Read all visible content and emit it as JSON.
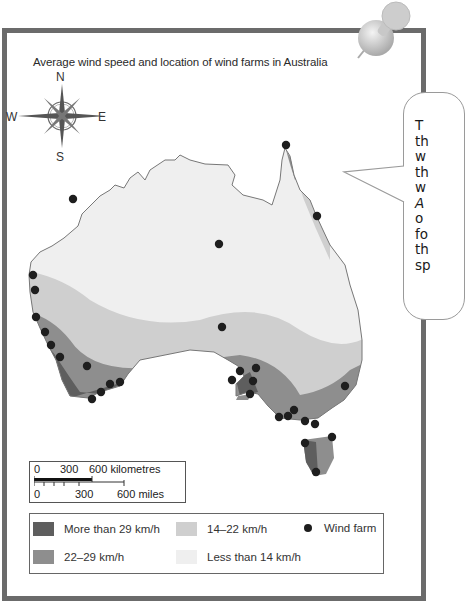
{
  "title": "Average wind speed and location of wind farms in Australia",
  "compass": {
    "north": "N",
    "south": "S",
    "east": "E",
    "west": "W"
  },
  "speech_bubble": {
    "visible_line_fragments": [
      "T",
      "th",
      "w",
      "th",
      "w",
      "A",
      "o",
      "fo",
      "th",
      "sp"
    ],
    "note": "text truncated at right edge of image"
  },
  "scale_bar": {
    "km_labels": [
      "0",
      "300",
      "600 kilometres"
    ],
    "mile_labels": [
      "0",
      "300",
      "600 miles"
    ]
  },
  "legend": {
    "items": [
      {
        "label": "More than 29 km/h",
        "color": "#5e5e5e"
      },
      {
        "label": "22–29 km/h",
        "color": "#8e8e8e"
      },
      {
        "label": "14–22 km/h",
        "color": "#cfcfcf"
      },
      {
        "label": "Less than 14 km/h",
        "color": "#efefef"
      },
      {
        "label": "Wind farm",
        "symbol": "dot",
        "color": "#1e1e1e"
      }
    ]
  },
  "colors": {
    "frame": "#6b6b6b",
    "zone_over_29": "#5e5e5e",
    "zone_22_29": "#8e8e8e",
    "zone_14_22": "#cfcfcf",
    "zone_under_14": "#efefef",
    "coastline": "#777777",
    "wind_farm": "#1e1e1e"
  },
  "wind_farms": [
    {
      "x": 73,
      "y": 199
    },
    {
      "x": 286,
      "y": 145
    },
    {
      "x": 317,
      "y": 216
    },
    {
      "x": 219,
      "y": 244
    },
    {
      "x": 33,
      "y": 275
    },
    {
      "x": 35,
      "y": 290
    },
    {
      "x": 36,
      "y": 317
    },
    {
      "x": 45,
      "y": 332
    },
    {
      "x": 51,
      "y": 345
    },
    {
      "x": 60,
      "y": 357
    },
    {
      "x": 87,
      "y": 366
    },
    {
      "x": 110,
      "y": 384
    },
    {
      "x": 120,
      "y": 382
    },
    {
      "x": 101,
      "y": 392
    },
    {
      "x": 92,
      "y": 399
    },
    {
      "x": 222,
      "y": 327
    },
    {
      "x": 256,
      "y": 368
    },
    {
      "x": 240,
      "y": 371
    },
    {
      "x": 232,
      "y": 380
    },
    {
      "x": 253,
      "y": 381
    },
    {
      "x": 250,
      "y": 394
    },
    {
      "x": 345,
      "y": 386
    },
    {
      "x": 294,
      "y": 410
    },
    {
      "x": 288,
      "y": 416
    },
    {
      "x": 279,
      "y": 417
    },
    {
      "x": 305,
      "y": 421
    },
    {
      "x": 315,
      "y": 424
    },
    {
      "x": 332,
      "y": 437
    },
    {
      "x": 305,
      "y": 443
    },
    {
      "x": 316,
      "y": 472
    }
  ]
}
